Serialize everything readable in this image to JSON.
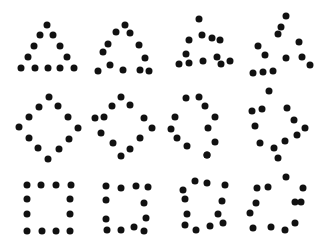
{
  "dot_color": "#111111",
  "background": "#ffffff",
  "rows": [
    {
      "shape": "triangle",
      "figures": [
        [
          [
            47,
            25
          ],
          [
            40,
            35
          ],
          [
            53,
            35
          ],
          [
            34,
            46
          ],
          [
            60,
            46
          ],
          [
            28,
            57
          ],
          [
            67,
            57
          ],
          [
            21,
            68
          ],
          [
            35,
            68
          ],
          [
            48,
            68
          ],
          [
            60,
            68
          ],
          [
            74,
            68
          ]
        ],
        [
          [
            125,
            25
          ],
          [
            116,
            32
          ],
          [
            130,
            33
          ],
          [
            108,
            44
          ],
          [
            139,
            45
          ],
          [
            103,
            52
          ],
          [
            145,
            58
          ],
          [
            98,
            71
          ],
          [
            110,
            65
          ],
          [
            123,
            70
          ],
          [
            140,
            70
          ],
          [
            149,
            71
          ]
        ],
        [
          [
            199,
            19
          ],
          [
            202,
            35
          ],
          [
            189,
            40
          ],
          [
            212,
            38
          ],
          [
            220,
            40
          ],
          [
            186,
            54
          ],
          [
            179,
            64
          ],
          [
            189,
            63
          ],
          [
            203,
            61
          ],
          [
            217,
            57
          ],
          [
            221,
            64
          ],
          [
            230,
            61
          ]
        ],
        [
          [
            286,
            16
          ],
          [
            281,
            27
          ],
          [
            278,
            34
          ],
          [
            258,
            46
          ],
          [
            265,
            55
          ],
          [
            299,
            42
          ],
          [
            286,
            58
          ],
          [
            302,
            57
          ],
          [
            310,
            65
          ],
          [
            253,
            73
          ],
          [
            263,
            72
          ],
          [
            273,
            71
          ]
        ]
      ]
    },
    {
      "shape": "diamond",
      "figures": [
        [
          [
            49,
            97
          ],
          [
            39,
            107
          ],
          [
            58,
            106
          ],
          [
            29,
            117
          ],
          [
            68,
            117
          ],
          [
            19,
            127
          ],
          [
            78,
            128
          ],
          [
            29,
            138
          ],
          [
            69,
            139
          ],
          [
            38,
            148
          ],
          [
            59,
            149
          ],
          [
            48,
            159
          ]
        ],
        [
          [
            121,
            97
          ],
          [
            112,
            106
          ],
          [
            130,
            105
          ],
          [
            95,
            118
          ],
          [
            104,
            117
          ],
          [
            144,
            118
          ],
          [
            101,
            133
          ],
          [
            152,
            128
          ],
          [
            140,
            138
          ],
          [
            113,
            143
          ],
          [
            130,
            149
          ],
          [
            121,
            156
          ]
        ],
        [
          [
            186,
            98
          ],
          [
            199,
            97
          ],
          [
            205,
            106
          ],
          [
            175,
            117
          ],
          [
            215,
            117
          ],
          [
            171,
            129
          ],
          [
            208,
            128
          ],
          [
            177,
            138
          ],
          [
            215,
            142
          ],
          [
            187,
            146
          ],
          [
            207,
            155
          ],
          [
            207,
            155
          ]
        ],
        [
          [
            269,
            91
          ],
          [
            252,
            111
          ],
          [
            262,
            109
          ],
          [
            287,
            108
          ],
          [
            255,
            126
          ],
          [
            294,
            120
          ],
          [
            305,
            128
          ],
          [
            260,
            143
          ],
          [
            285,
            141
          ],
          [
            297,
            135
          ],
          [
            274,
            148
          ],
          [
            278,
            158
          ]
        ]
      ]
    },
    {
      "shape": "square",
      "figures": [
        [
          [
            27,
            185
          ],
          [
            41,
            185
          ],
          [
            56,
            185
          ],
          [
            71,
            185
          ],
          [
            27,
            199
          ],
          [
            70,
            199
          ],
          [
            27,
            214
          ],
          [
            70,
            214
          ],
          [
            27,
            231
          ],
          [
            42,
            231
          ],
          [
            56,
            231
          ],
          [
            70,
            231
          ]
        ],
        [
          [
            106,
            186
          ],
          [
            121,
            188
          ],
          [
            136,
            186
          ],
          [
            148,
            187
          ],
          [
            106,
            200
          ],
          [
            144,
            203
          ],
          [
            106,
            219
          ],
          [
            146,
            218
          ],
          [
            107,
            230
          ],
          [
            121,
            230
          ],
          [
            134,
            227
          ],
          [
            144,
            231
          ]
        ],
        [
          [
            195,
            181
          ],
          [
            207,
            183
          ],
          [
            225,
            185
          ],
          [
            183,
            190
          ],
          [
            185,
            199
          ],
          [
            222,
            201
          ],
          [
            187,
            214
          ],
          [
            218,
            214
          ],
          [
            185,
            225
          ],
          [
            196,
            230
          ],
          [
            210,
            226
          ],
          [
            223,
            223
          ]
        ],
        [
          [
            286,
            177
          ],
          [
            257,
            188
          ],
          [
            268,
            187
          ],
          [
            303,
            188
          ],
          [
            256,
            203
          ],
          [
            295,
            202
          ],
          [
            301,
            202
          ],
          [
            250,
            213
          ],
          [
            295,
            223
          ],
          [
            253,
            228
          ],
          [
            271,
            227
          ],
          [
            285,
            230
          ]
        ]
      ]
    }
  ]
}
